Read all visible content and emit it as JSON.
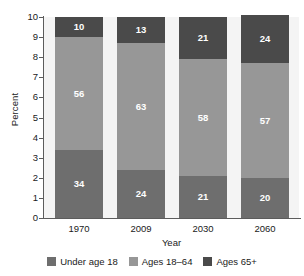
{
  "chart_data": {
    "type": "bar",
    "subtype": "stacked-bar-100-percent",
    "title": "",
    "xlabel": "Year",
    "ylabel": "Percent",
    "categories": [
      "1970",
      "2009",
      "2030",
      "2060"
    ],
    "series": [
      {
        "name": "Under age 18",
        "color": "#6e6e6e",
        "values": [
          34,
          24,
          21,
          20
        ]
      },
      {
        "name": "Ages 18–64",
        "color": "#979797",
        "values": [
          56,
          63,
          58,
          57
        ]
      },
      {
        "name": "Ages 65+",
        "color": "#4a4a4a",
        "values": [
          10,
          13,
          21,
          24
        ]
      }
    ],
    "ylim": [
      0,
      10
    ],
    "yticks": [
      "10",
      "9",
      "8",
      "7",
      "6",
      "5",
      "4",
      "3",
      "2",
      "1",
      "0"
    ],
    "axis_scale_note": "axis units are tens of percent (10 = 100%)",
    "grid": false,
    "legend_position": "bottom",
    "plot_background": "#f4f4f4",
    "axis_color": "#5c5c5c",
    "label_text_color": "#ffffff"
  },
  "legend": {
    "items": [
      {
        "label": "Under age 18"
      },
      {
        "label": "Ages 18–64"
      },
      {
        "label": "Ages 65+"
      }
    ]
  }
}
